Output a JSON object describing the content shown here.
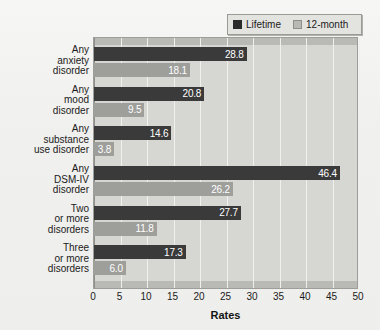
{
  "chart_data": {
    "type": "bar",
    "orientation": "horizontal",
    "title": "",
    "xlabel": "Rates",
    "ylabel": "",
    "xlim": [
      0,
      50
    ],
    "xticks": [
      0,
      5,
      10,
      15,
      20,
      25,
      30,
      35,
      40,
      45,
      50
    ],
    "grid": true,
    "legend_position": "top-right",
    "categories": [
      "Any anxiety disorder",
      "Any mood disorder",
      "Any substance use disorder",
      "Any DSM-IV disorder",
      "Two or more disorders",
      "Three or more disorders"
    ],
    "category_lines": [
      [
        "Any",
        "anxiety",
        "disorder"
      ],
      [
        "Any",
        "mood",
        "disorder"
      ],
      [
        "Any",
        "substance",
        "use disorder"
      ],
      [
        "Any",
        "DSM-IV",
        "disorder"
      ],
      [
        "Two",
        "or more",
        "disorders"
      ],
      [
        "Three",
        "or more",
        "disorders"
      ]
    ],
    "series": [
      {
        "name": "Lifetime",
        "color": "#3a3a3a",
        "values": [
          28.8,
          20.8,
          14.6,
          46.4,
          27.7,
          17.3
        ],
        "labels": [
          "28.8",
          "20.8",
          "14.6",
          "46.4",
          "27.7",
          "17.3"
        ]
      },
      {
        "name": "12-month",
        "color": "#9e9e9b",
        "values": [
          18.1,
          9.5,
          3.8,
          26.2,
          11.8,
          6.0
        ],
        "labels": [
          "18.1",
          "9.5",
          "3.8",
          "26.2",
          "11.8",
          "6.0"
        ]
      }
    ]
  },
  "legend": {
    "entries": [
      {
        "label": "Lifetime",
        "swatch": "dark-swatch-icon"
      },
      {
        "label": "12-month",
        "swatch": "light-swatch-icon"
      }
    ]
  },
  "axis": {
    "x_label": "Rates",
    "tick_labels": [
      "0",
      "5",
      "10",
      "15",
      "20",
      "25",
      "30",
      "35",
      "40",
      "45",
      "50"
    ]
  },
  "colors": {
    "background": "#eeeeec",
    "plot_area": "#d6d6d3",
    "band": "#b9b9b6",
    "lifetime": "#3a3a3a",
    "twelve_month": "#9e9e9b",
    "gridline": "#f0f0ee",
    "text": "#1b1b1b"
  }
}
